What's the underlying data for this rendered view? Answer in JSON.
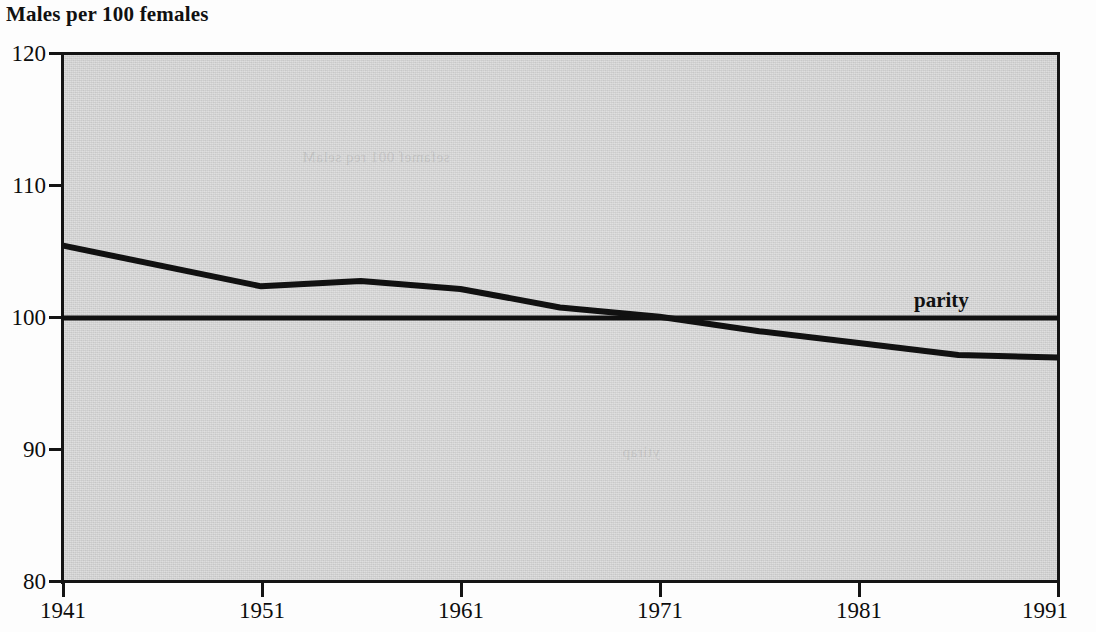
{
  "chart_data": {
    "type": "line",
    "title": "Males per 100 females",
    "xlabel": "",
    "ylabel": "Males per 100 females",
    "xlim": [
      1941,
      1991
    ],
    "ylim": [
      80,
      120
    ],
    "ytick_labels": [
      "120",
      "110",
      "100",
      "90",
      "80"
    ],
    "ytick_values": [
      120,
      110,
      100,
      90,
      80
    ],
    "xtick_labels": [
      "1941",
      "1951",
      "1961",
      "1971",
      "1981",
      "1991"
    ],
    "xtick_values": [
      1941,
      1951,
      1961,
      1971,
      1981,
      1991
    ],
    "grid": false,
    "legend_position": "inline-annotation",
    "plot_background": "#d2d2d2",
    "line_color": "#111111",
    "series": [
      {
        "name": "sex ratio",
        "x": [
          1941,
          1951,
          1956,
          1961,
          1966,
          1971,
          1976,
          1981,
          1986,
          1991
        ],
        "values": [
          105.5,
          102.4,
          102.8,
          102.2,
          100.8,
          100.1,
          99.0,
          98.1,
          97.2,
          97.0
        ]
      },
      {
        "name": "parity",
        "x": [
          1941,
          1991
        ],
        "values": [
          100,
          100
        ]
      }
    ],
    "annotations": [
      {
        "text": "parity",
        "x": 1985,
        "y": 101.5
      }
    ]
  },
  "figure": {
    "title": "Males per 100 females",
    "parity_label": "parity"
  }
}
